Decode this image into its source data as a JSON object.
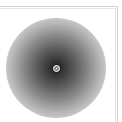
{
  "widget": {
    "type": "radial-gradient-preview",
    "colors": {
      "center": "#1e1e1e",
      "edge": "#ffffff",
      "frame": "#d4d4d4"
    },
    "marker": {
      "icon": "crosshair-icon",
      "x": 56,
      "y": 68
    }
  }
}
